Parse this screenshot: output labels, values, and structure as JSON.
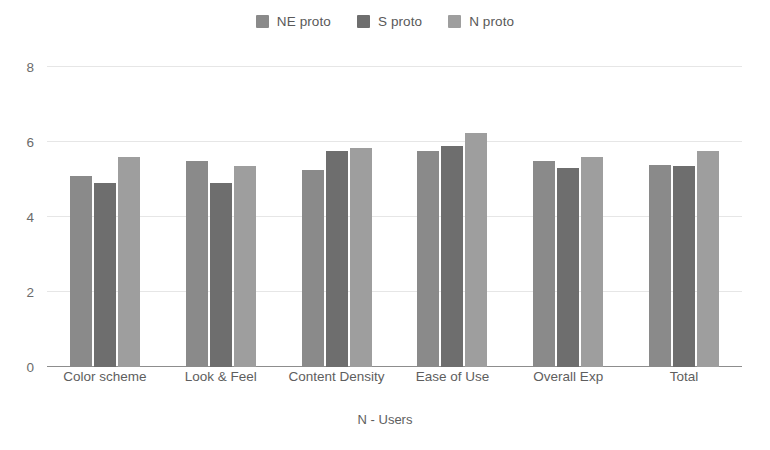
{
  "chart_data": {
    "type": "bar",
    "title": "",
    "xlabel": "N - Users",
    "ylabel": "",
    "ylim": [
      0,
      8
    ],
    "yticks": [
      0,
      2,
      4,
      6,
      8
    ],
    "grid": true,
    "legend_position": "top-center",
    "categories": [
      "Color scheme",
      "Look & Feel",
      "Content Density",
      "Ease of Use",
      "Overall Exp",
      "Total"
    ],
    "series": [
      {
        "name": "NE proto",
        "color": "#8a8a8a",
        "values": [
          5.1,
          5.5,
          5.25,
          5.75,
          5.5,
          5.4
        ]
      },
      {
        "name": "S proto",
        "color": "#6e6e6e",
        "values": [
          4.9,
          4.9,
          5.75,
          5.9,
          5.3,
          5.35
        ]
      },
      {
        "name": "N proto",
        "color": "#9e9e9e",
        "values": [
          5.6,
          5.35,
          5.85,
          6.25,
          5.6,
          5.75
        ]
      }
    ]
  },
  "legend": {
    "items": [
      {
        "label": "NE proto"
      },
      {
        "label": "S proto"
      },
      {
        "label": "N proto"
      }
    ]
  },
  "axis": {
    "y_tick_labels": [
      "8",
      "6",
      "4",
      "2",
      "0"
    ],
    "x_tick_labels": [
      "Color scheme",
      "Look & Feel",
      "Content Density",
      "Ease of Use",
      "Overall Exp",
      "Total"
    ],
    "x_title": "N - Users"
  },
  "colors": {
    "series_1": "#8a8a8a",
    "series_2": "#6e6e6e",
    "series_3": "#9e9e9e",
    "grid": "#e6e6e6",
    "axis": "#8d8d8d",
    "text": "#5a5a5a",
    "background": "#ffffff"
  }
}
